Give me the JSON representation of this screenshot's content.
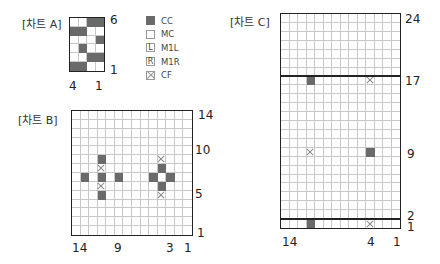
{
  "colors": {
    "cc": "#6a6a6a",
    "mc": "#ffffff",
    "grid_line": "#c8c8c8",
    "border": "#222222"
  },
  "legend": [
    {
      "symbol": "D",
      "glyph": "",
      "label": "CC"
    },
    {
      "symbol": "W",
      "glyph": "",
      "label": "MC"
    },
    {
      "symbol": "L",
      "glyph": "L",
      "label": "M1L"
    },
    {
      "symbol": "R",
      "glyph": "R",
      "label": "M1R"
    },
    {
      "symbol": "X",
      "glyph": "",
      "label": "CF"
    }
  ],
  "chart_data": [
    {
      "type": "table",
      "title": "[차트 A]",
      "cols": 4,
      "rows": 6,
      "col_labels": [
        {
          "text": "4",
          "col": 4
        },
        {
          "text": "1",
          "col": 1
        }
      ],
      "row_labels": [
        {
          "text": "6",
          "row": 6
        },
        {
          "text": "1",
          "row": 1
        }
      ],
      "grid_top_to_bottom": [
        "WWDD",
        "DDWW",
        "WWWD",
        "WDWW",
        "WWDD",
        "DDWW"
      ]
    },
    {
      "type": "table",
      "title": "[차트 B]",
      "cols": 14,
      "rows": 14,
      "col_labels": [
        {
          "text": "14",
          "col": 14
        },
        {
          "text": "9",
          "col": 9
        },
        {
          "text": "3",
          "col": 3
        },
        {
          "text": "1",
          "col": 1
        }
      ],
      "row_labels": [
        {
          "text": "14",
          "row": 14
        },
        {
          "text": "10",
          "row": 10
        },
        {
          "text": "5",
          "row": 5
        },
        {
          "text": "1",
          "row": 1
        }
      ],
      "grid_top_to_bottom": [
        "WWWWWWWWWWWWWW",
        "WWWWWWWWWWWWWW",
        "WWWWWWWWWWWWWW",
        "WWWWWWWWWWWWWW",
        "WWWWWWWWWWWWWW",
        "WWWDWWWWWWXWWW",
        "WWWXWWWWWWDWWW",
        "WDWDWDWWWDWDWW",
        "WWWXWWWWWWDWWW",
        "WWWDWWWWWWXWWW",
        "WWWWWWWWWWWWWW",
        "WWWWWWWWWWWWWW",
        "WWWWWWWWWWWWWW",
        "WWWWWWWWWWWWWW"
      ]
    },
    {
      "type": "table",
      "title": "[차트 C]",
      "cols": 14,
      "rows": 24,
      "col_labels": [
        {
          "text": "14",
          "col": 14
        },
        {
          "text": "4",
          "col": 4
        },
        {
          "text": "1",
          "col": 1
        }
      ],
      "row_labels": [
        {
          "text": "24",
          "row": 24
        },
        {
          "text": "17",
          "row": 17
        },
        {
          "text": "9",
          "row": 9
        },
        {
          "text": "2",
          "row": 2
        },
        {
          "text": "1",
          "row": 1
        }
      ],
      "thick_lines_above_rows": [
        17,
        1
      ],
      "grid_top_to_bottom": [
        "WWWWWWWWWWWWWW",
        "WWWWWWWWWWWWWW",
        "WWWWWWWWWWWWWW",
        "WWWWWWWWWWWWWW",
        "WWWWWWWWWWWWWW",
        "WWWWWWWWWWWWWW",
        "WWWWWWWWWWWWWW",
        "WWWDWWWWWWXWWW",
        "WWWWWWWWWWWWWW",
        "WWWWWWWWWWWWWW",
        "WWWWWWWWWWWWWW",
        "WWWWWWWWWWWWWW",
        "WWWWWWWWWWWWWW",
        "WWWWWWWWWWWWWW",
        "WWWWWWWWWWWWWW",
        "WWWXWWWWWWDWWW",
        "WWWWWWWWWWWWWW",
        "WWWWWWWWWWWWWW",
        "WWWWWWWWWWWWWW",
        "WWWWWWWWWWWWWW",
        "WWWWWWWWWWWWWW",
        "WWWWWWWWWWWWWW",
        "WWWWWWWWWWWWWW",
        "WWWDWWWWWWXWWW"
      ]
    }
  ]
}
